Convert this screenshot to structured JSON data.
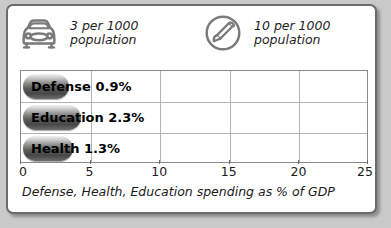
{
  "legend": {
    "items": [
      {
        "icon": "car-icon",
        "text": "3 per 1000\npopulation"
      },
      {
        "icon": "phone-icon",
        "text": "10 per 1000\npopulation"
      }
    ]
  },
  "caption": "Defense, Health, Education spending as % of GDP",
  "colors": {
    "page_background": "#c9c9c9",
    "card_background": "#ffffff",
    "card_border": "#6b6b6b",
    "grid": "#b4b4b4",
    "plot_border": "#8a8a8a",
    "bar_dark": "#474747",
    "bar_light": "#f2f2f2",
    "text": "#1a1a1a",
    "icon": "#7a7a7a"
  },
  "chart_data": {
    "type": "bar",
    "orientation": "horizontal",
    "title": "",
    "xlabel": "Defense, Health, Education spending as % of GDP",
    "ylabel": "",
    "xlim": [
      0,
      25
    ],
    "xticks": [
      0,
      5,
      10,
      15,
      20,
      25
    ],
    "xtick_labels": [
      "0",
      "5",
      "10",
      "15",
      "20",
      "25"
    ],
    "grid": true,
    "legend_position": "above-plot",
    "categories": [
      "Defense",
      "Education",
      "Health"
    ],
    "values": [
      0.9,
      2.3,
      1.3
    ],
    "unit": "%",
    "data_labels": [
      "Defense 0.9%",
      "Education 2.3%",
      "Health 1.3%"
    ],
    "bar_pixel_widths": [
      46,
      58,
      50
    ]
  }
}
